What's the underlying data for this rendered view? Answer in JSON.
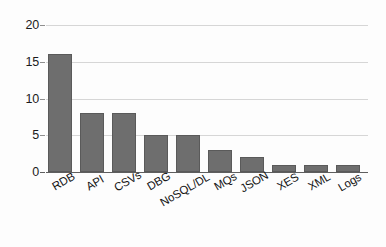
{
  "chart_data": {
    "type": "bar",
    "title": "",
    "subtitle": "",
    "xlabel": "",
    "ylabel": "",
    "categories": [
      "RDB",
      "API",
      "CSVs",
      "DBG",
      "NoSQL/DL",
      "MQs",
      "JSON",
      "XES",
      "XML",
      "Logs"
    ],
    "values": [
      16,
      8,
      8,
      5,
      5,
      3,
      2,
      1,
      1,
      1
    ],
    "ylim": [
      0,
      20
    ],
    "yticks": [
      0,
      5,
      10,
      15,
      20
    ],
    "ytick_labels": [
      "0",
      "5",
      "10",
      "15",
      "20"
    ],
    "grid": true,
    "grid_axis": "y",
    "legend": false,
    "legend_position": "none",
    "annotations": [],
    "colors": {
      "bar_fill": "#6e6e6e",
      "bar_border": "#5a5a5a",
      "gridline": "#d6d6d6",
      "axis_line": "#5e5e5e",
      "tick_text": "#1b1b1b",
      "category_text": "#141414",
      "background": "#fdfdfd"
    }
  }
}
